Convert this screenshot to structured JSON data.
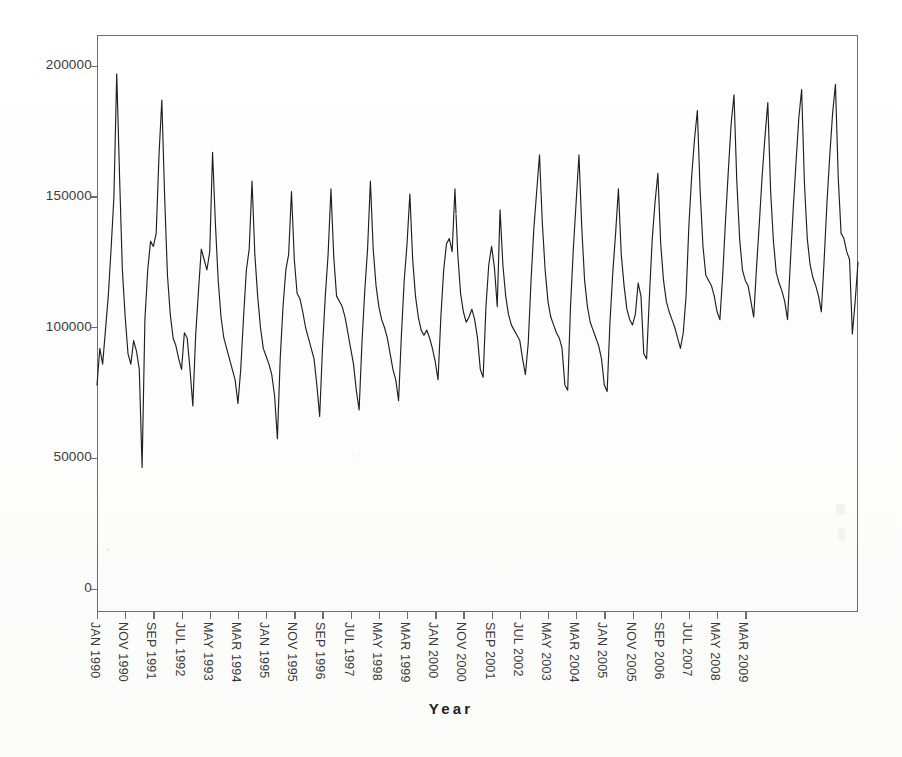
{
  "chart_data": {
    "type": "line",
    "title": "",
    "subtitle": "",
    "xlabel": "Year",
    "ylabel": "",
    "grid": false,
    "legend": "none",
    "line_color": "#1f1f1f",
    "frame_color": "#6d6d6d",
    "background": "#fdfdfd",
    "ylim": [
      0,
      215000
    ],
    "yticks": [
      0,
      50000,
      100000,
      150000,
      200000
    ],
    "ytick_labels": [
      "0",
      "50000",
      "100000",
      "150000",
      "200000"
    ],
    "x_start": "JAN 1990",
    "x_end": "MAR 2009",
    "x_step_months": 10,
    "xtick_labels": [
      "JAN 1990",
      "NOV 1990",
      "SEP 1991",
      "JUL 1992",
      "MAY 1993",
      "MAR 1994",
      "JAN 1995",
      "NOV 1995",
      "SEP 1996",
      "JUL 1997",
      "MAY 1998",
      "MAR 1999",
      "JAN 2000",
      "NOV 2000",
      "SEP 2001",
      "JUL 2002",
      "MAY 2003",
      "MAR 2004",
      "JAN 2005",
      "NOV 2005",
      "SEP 2006",
      "JUL 2007",
      "MAY 2008",
      "MAR 2009"
    ],
    "series": [
      {
        "name": "monthly value",
        "values": [
          78000,
          92000,
          86000,
          99000,
          112000,
          130000,
          150000,
          197000,
          158000,
          122000,
          104000,
          90000,
          86000,
          95000,
          91000,
          84000,
          46500,
          103000,
          122000,
          133000,
          131000,
          136000,
          166000,
          187000,
          150000,
          120000,
          105000,
          96000,
          93000,
          88000,
          84000,
          98000,
          96000,
          84000,
          70000,
          97000,
          114000,
          130000,
          126000,
          122000,
          129000,
          167000,
          140000,
          118000,
          104000,
          96000,
          92000,
          88000,
          84000,
          80000,
          71000,
          84000,
          104000,
          122000,
          130000,
          156000,
          128000,
          112000,
          100000,
          92000,
          89000,
          86000,
          82000,
          74000,
          57500,
          88000,
          108000,
          122000,
          128000,
          152000,
          126000,
          113000,
          111000,
          106000,
          100000,
          96000,
          92000,
          88000,
          78000,
          66000,
          92000,
          112000,
          128000,
          153000,
          127000,
          112000,
          110000,
          108000,
          104000,
          98000,
          92000,
          86000,
          76000,
          68500,
          94000,
          114000,
          130000,
          156000,
          130000,
          116000,
          108000,
          103000,
          100000,
          96000,
          90000,
          84000,
          80000,
          72000,
          97000,
          118000,
          132000,
          151000,
          126000,
          112000,
          104000,
          99000,
          97000,
          99000,
          96000,
          92000,
          87000,
          80000,
          104000,
          122000,
          132000,
          134000,
          129000,
          153000,
          128000,
          113000,
          106000,
          102000,
          104000,
          107000,
          103000,
          96000,
          84000,
          81000,
          108000,
          124000,
          131000,
          123000,
          108000,
          145000,
          124000,
          112000,
          105000,
          101000,
          99000,
          97000,
          95000,
          88000,
          82000,
          94000,
          118000,
          138000,
          152000,
          166000,
          140000,
          122000,
          110000,
          104000,
          101000,
          98000,
          96000,
          92000,
          78000,
          76000,
          108000,
          130000,
          148000,
          166000,
          138000,
          118000,
          108000,
          102000,
          99000,
          96000,
          93000,
          88000,
          78000,
          75500,
          102000,
          121000,
          136000,
          153000,
          128000,
          116000,
          107000,
          103000,
          101000,
          105000,
          117000,
          112000,
          90000,
          88000,
          112000,
          134000,
          148000,
          159000,
          132000,
          118000,
          110000,
          106000,
          103000,
          100000,
          96000,
          92000,
          98000,
          112000,
          139000,
          158000,
          172000,
          183000,
          152000,
          131000,
          120000,
          118000,
          116000,
          112000,
          106000,
          103000,
          120000,
          141000,
          160000,
          178000,
          189000,
          156000,
          134000,
          122000,
          118000,
          116000,
          110000,
          104000,
          123000,
          140000,
          158000,
          173000,
          186000,
          152000,
          133000,
          121000,
          117000,
          114000,
          110000,
          103000,
          125000,
          145000,
          163000,
          180000,
          191000,
          155000,
          134000,
          124000,
          119000,
          116000,
          112000,
          106000,
          126000,
          148000,
          166000,
          182000,
          193000,
          157000,
          136000,
          134000,
          129000,
          126000,
          97500,
          110000,
          125000
        ]
      }
    ],
    "annotations": {
      "max_value": 197000,
      "max_label": "JAN 1990 season peak",
      "min_value": 46500,
      "min_label": "1991 trough"
    }
  },
  "axis": {
    "x_title": "Year"
  }
}
